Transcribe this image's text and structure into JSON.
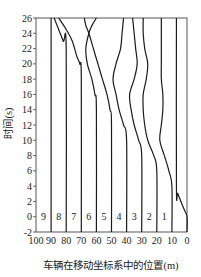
{
  "chart_data": {
    "type": "line",
    "title": "",
    "xlabel": "车辆在移动坐标系中的位置(m)",
    "ylabel": "时间(s)",
    "xlim": [
      100,
      0
    ],
    "ylim": [
      -2,
      26
    ],
    "x_reversed": true,
    "grid": false,
    "x_ticks": [
      100,
      90,
      80,
      70,
      60,
      50,
      40,
      30,
      20,
      10,
      0
    ],
    "y_ticks": [
      -2,
      0,
      2,
      4,
      6,
      8,
      10,
      12,
      14,
      16,
      18,
      20,
      22,
      24,
      26
    ],
    "lane_labels": [
      {
        "label": "9",
        "x": 95
      },
      {
        "label": "8",
        "x": 85
      },
      {
        "label": "7",
        "x": 75
      },
      {
        "label": "6",
        "x": 65
      },
      {
        "label": "5",
        "x": 55
      },
      {
        "label": "4",
        "x": 45
      },
      {
        "label": "3",
        "x": 35
      },
      {
        "label": "2",
        "x": 25
      },
      {
        "label": "1",
        "x": 15
      }
    ],
    "lane_label_y": 0,
    "series": [
      {
        "name": "1",
        "points": [
          [
            0,
            -2
          ],
          [
            0,
            0
          ],
          [
            2,
            1
          ],
          [
            6,
            3
          ],
          [
            7,
            4
          ],
          [
            7,
            26
          ]
        ]
      },
      {
        "name": "2",
        "points": [
          [
            10,
            -2
          ],
          [
            10,
            4
          ],
          [
            12,
            6
          ],
          [
            15,
            8
          ],
          [
            18,
            10
          ],
          [
            17,
            12
          ],
          [
            16,
            14
          ],
          [
            16,
            16
          ],
          [
            17,
            18
          ],
          [
            17,
            20
          ],
          [
            17,
            22
          ],
          [
            17,
            26
          ]
        ]
      },
      {
        "name": "3",
        "points": [
          [
            20,
            -2
          ],
          [
            20,
            6
          ],
          [
            22,
            8
          ],
          [
            26,
            10
          ],
          [
            28,
            12
          ],
          [
            29,
            14
          ],
          [
            29,
            16
          ],
          [
            27,
            18
          ],
          [
            26,
            20
          ],
          [
            28,
            22
          ],
          [
            29,
            24
          ],
          [
            29,
            26
          ]
        ]
      },
      {
        "name": "4",
        "points": [
          [
            30,
            -2
          ],
          [
            30,
            8
          ],
          [
            32,
            10
          ],
          [
            35,
            12
          ],
          [
            37,
            14
          ],
          [
            38,
            16
          ],
          [
            35,
            18
          ],
          [
            33,
            20
          ],
          [
            34,
            22
          ],
          [
            35,
            24
          ],
          [
            36,
            26
          ]
        ]
      },
      {
        "name": "5",
        "points": [
          [
            40,
            -2
          ],
          [
            40,
            10
          ],
          [
            42,
            12
          ],
          [
            45,
            14
          ],
          [
            47,
            16
          ],
          [
            49,
            18
          ],
          [
            47,
            20
          ],
          [
            44,
            22
          ],
          [
            43,
            24
          ],
          [
            42,
            26
          ]
        ]
      },
      {
        "name": "6",
        "points": [
          [
            50,
            -2
          ],
          [
            50,
            12
          ],
          [
            51,
            14
          ],
          [
            53,
            16
          ],
          [
            56,
            18
          ],
          [
            59,
            20
          ],
          [
            62,
            22
          ],
          [
            65,
            24
          ],
          [
            67,
            25
          ],
          [
            68,
            26
          ]
        ]
      },
      {
        "name": "7",
        "points": [
          [
            60,
            -2
          ],
          [
            60,
            14
          ],
          [
            61,
            16
          ],
          [
            63,
            18
          ],
          [
            66,
            20
          ],
          [
            67,
            22
          ],
          [
            65,
            24
          ],
          [
            63,
            25
          ],
          [
            60,
            26
          ]
        ]
      },
      {
        "name": "8",
        "points": [
          [
            70,
            -2
          ],
          [
            70,
            18
          ],
          [
            71,
            20
          ],
          [
            73,
            21
          ],
          [
            76,
            23
          ],
          [
            80,
            24.5
          ],
          [
            85,
            26
          ]
        ]
      },
      {
        "name": "9",
        "points": [
          [
            80,
            -2
          ],
          [
            80,
            22
          ],
          [
            82,
            23
          ],
          [
            86,
            25
          ],
          [
            88,
            26
          ]
        ]
      },
      {
        "name": "9b",
        "points": [
          [
            90,
            -2
          ],
          [
            90,
            26
          ]
        ]
      }
    ]
  },
  "plot": {
    "left_px": 36,
    "right_px": 187,
    "top_px": 18,
    "bottom_px": 232
  },
  "labels": {
    "xlabel": "车辆在移动坐标系中的位置(m)",
    "ylabel": "时间(s)"
  }
}
